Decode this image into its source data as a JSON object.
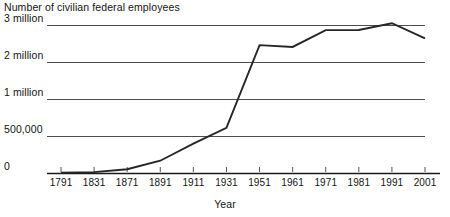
{
  "chart_data": {
    "type": "line",
    "title": "Number of civilian federal employees",
    "xlabel": "Year",
    "ylabel": "",
    "categories": [
      "1791",
      "1831",
      "1871",
      "1891",
      "1911",
      "1931",
      "1951",
      "1961",
      "1971",
      "1981",
      "1991",
      "2001"
    ],
    "x": [
      1791,
      1831,
      1871,
      1891,
      1911,
      1931,
      1951,
      1961,
      1971,
      1981,
      1991,
      2001
    ],
    "values": [
      5000,
      12000,
      51000,
      166000,
      396000,
      610000,
      2456000,
      2407000,
      2862000,
      2865000,
      3048000,
      2640000
    ],
    "value_labels": [
      "5,000",
      "12,000",
      "51,000",
      "166,000",
      "396,000",
      "610,000",
      "2.25 million",
      "2.2 million",
      "2.6 million",
      "2.8 million",
      "3 million",
      "2.2 million"
    ],
    "ytick_labels": [
      "0",
      "500,000",
      "1 million",
      "2 million",
      "3 million"
    ],
    "ytick_values": [
      0,
      500000,
      1000000,
      2000000,
      3000000
    ],
    "ylim": [
      0,
      3000000
    ],
    "yscale": "piecewise-equal-spacing",
    "grid": true,
    "legend": false,
    "series": [
      {
        "name": "Number of civilian federal employees",
        "color": "#262626",
        "values": [
          5000,
          12000,
          51000,
          166000,
          396000,
          610000,
          2456000,
          2407000,
          2862000,
          2865000,
          3048000,
          2640000
        ]
      }
    ],
    "colors": {
      "line": "#262626",
      "grid": "#4d4d4d",
      "axis": "#1a1a1a",
      "text": "#141414",
      "background": "#ffffff"
    }
  }
}
